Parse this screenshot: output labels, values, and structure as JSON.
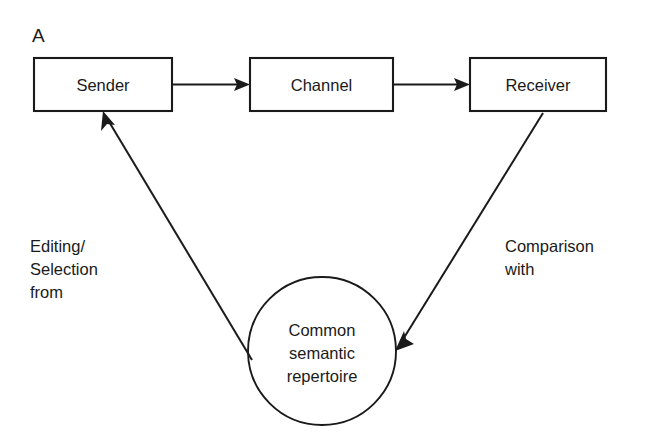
{
  "figure": {
    "panel_label": "A",
    "background_color": "#ffffff",
    "ink_color": "#1a1a1a",
    "width": 645,
    "height": 447
  },
  "nodes": {
    "sender": {
      "label": "Sender",
      "shape": "rectangle"
    },
    "channel": {
      "label": "Channel",
      "shape": "rectangle"
    },
    "receiver": {
      "label": "Receiver",
      "shape": "rectangle"
    },
    "repertoire": {
      "shape": "circle",
      "label_line1": "Common",
      "label_line2": "semantic",
      "label_line3": "repertoire"
    }
  },
  "edge_labels": {
    "left": {
      "line1": "Editing/",
      "line2": "Selection",
      "line3": "from"
    },
    "right": {
      "line1": "Comparison",
      "line2": "with"
    }
  },
  "edges": [
    {
      "name": "sender-to-channel",
      "from": "sender",
      "to": "channel",
      "arrow": "to"
    },
    {
      "name": "channel-to-receiver",
      "from": "channel",
      "to": "receiver",
      "arrow": "to"
    },
    {
      "name": "repertoire-to-sender",
      "from": "repertoire",
      "to": "sender",
      "arrow": "to"
    },
    {
      "name": "receiver-to-repertoire",
      "from": "receiver",
      "to": "repertoire",
      "arrow": "to"
    }
  ]
}
